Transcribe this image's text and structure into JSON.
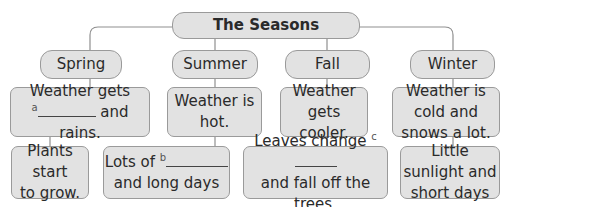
{
  "diagram": {
    "title": "The Seasons",
    "seasons": [
      {
        "name": "Spring",
        "weather_line1": "Weather gets",
        "weather_blank_label": "a",
        "weather_line2": "and rains.",
        "detail_line1": "Plants start",
        "detail_line2": "to grow."
      },
      {
        "name": "Summer",
        "weather": "Weather is hot.",
        "detail_line1": "Lots of",
        "detail_blank_label": "b",
        "detail_line2": "and long days"
      },
      {
        "name": "Fall",
        "weather_line1": "Weather gets",
        "weather_line2": "cooler.",
        "detail_line1": "Leaves change",
        "detail_blank_label": "c",
        "detail_line2": "and fall off the trees."
      },
      {
        "name": "Winter",
        "weather_line1": "Weather is cold and",
        "weather_line2": "snows a lot.",
        "detail_line1": "Little sunlight and",
        "detail_line2": "short days"
      }
    ]
  }
}
